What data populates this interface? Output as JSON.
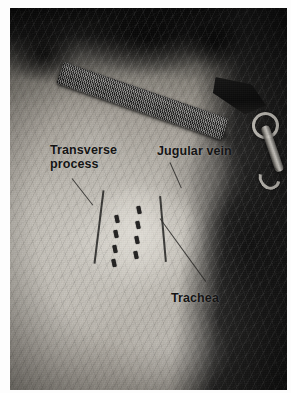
{
  "image": {
    "kind": "photograph",
    "subject": "dog-neck-jugular-venipuncture-landmarks",
    "palette": "grayscale",
    "background_color": "#ffffff",
    "plate_color": "#0a0a0a"
  },
  "annotations": {
    "labels": [
      {
        "id": "transverse-process",
        "text": "Transverse\nprocess",
        "color": "#141414"
      },
      {
        "id": "jugular-vein",
        "text": "Jugular vein",
        "color": "#141414"
      },
      {
        "id": "trachea",
        "text": "Trachea",
        "color": "#141414"
      }
    ],
    "leader_line_color": "#2a2927"
  },
  "photo_elements": {
    "collar": "nylon-webbing-collar",
    "clip": "metal-leash-snap-hook",
    "ring": "metal-o-ring",
    "patch": "clipped-shaved-skin-patch",
    "marks": "skin-marker-dashes"
  }
}
